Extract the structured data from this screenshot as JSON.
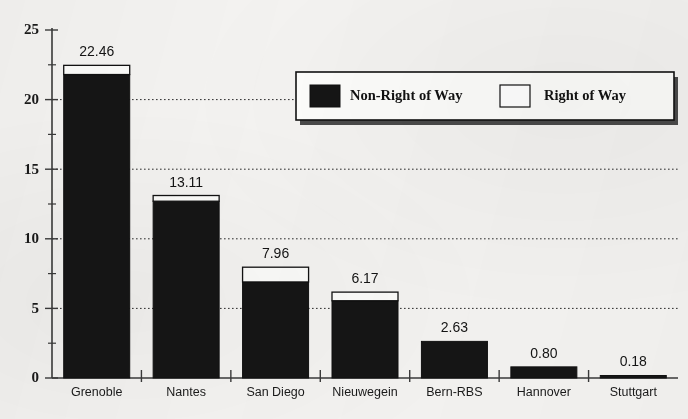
{
  "chart_data": {
    "type": "bar",
    "subtype": "stacked-bar",
    "title": "",
    "xlabel": "",
    "ylabel": "",
    "ylim": [
      0,
      25
    ],
    "y_ticks": [
      0,
      5,
      10,
      15,
      20,
      25
    ],
    "y_minor_ticks": [
      2.5,
      7.5,
      12.5,
      17.5,
      22.5
    ],
    "grid": "horizontal-dotted",
    "gridlines_at": [
      5,
      10,
      15,
      20
    ],
    "legend_position": "upper-right-inside",
    "categories": [
      "Grenoble",
      "Nantes",
      "San Diego",
      "Nieuwegein",
      "Bern-RBS",
      "Hannover",
      "Stuttgart"
    ],
    "totals": [
      22.46,
      13.11,
      7.96,
      6.17,
      2.63,
      0.8,
      0.18
    ],
    "data_labels": [
      "22.46",
      "13.11",
      "7.96",
      "6.17",
      "2.63",
      "0.80",
      "0.18"
    ],
    "series": [
      {
        "name": "Non-Right of Way",
        "color": "#151515",
        "values": [
          21.8,
          12.7,
          6.9,
          5.55,
          2.63,
          0.8,
          0.18
        ]
      },
      {
        "name": "Right of Way",
        "color": "#ffffff",
        "values": [
          0.66,
          0.41,
          1.06,
          0.62,
          0.0,
          0.0,
          0.0
        ]
      }
    ]
  },
  "legend": {
    "entries": [
      {
        "label": "Non-Right of Way",
        "swatch": "filled-black"
      },
      {
        "label": "Right of Way",
        "swatch": "outlined-white"
      }
    ]
  },
  "colors": {
    "background": "#f4f3f1",
    "series_dark": "#151515",
    "series_light": "#ffffff",
    "axis": "#3a3a3a",
    "text": "#1a1a1a"
  }
}
